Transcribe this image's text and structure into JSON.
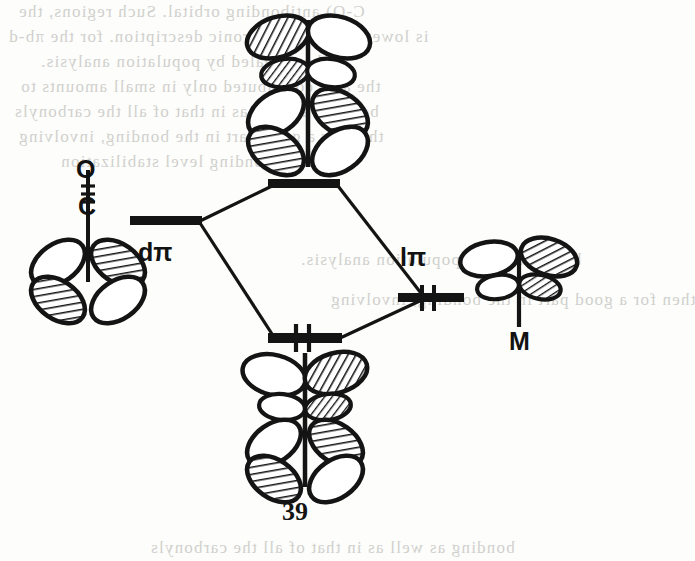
{
  "figure": {
    "number": "39",
    "caption_number": "39",
    "type": "molecular-orbital-interaction-diagram"
  },
  "labels": {
    "co_oxygen": "O",
    "co_carbon": "C",
    "d_pi": "dπ",
    "l_pi": "lπ",
    "metal": "M"
  },
  "energy_levels": [
    {
      "name": "antibonding",
      "label": "",
      "electrons": 0,
      "x": 305,
      "y": 185
    },
    {
      "name": "d-pi",
      "label": "dπ",
      "electrons": 0,
      "x": 166,
      "y": 222
    },
    {
      "name": "l-pi",
      "label": "lπ",
      "electrons": 2,
      "x": 430,
      "y": 298
    },
    {
      "name": "bonding",
      "label": "",
      "electrons": 2,
      "x": 305,
      "y": 338
    }
  ],
  "orbitals": [
    {
      "name": "antibonding-combination",
      "position": "top",
      "lobes": 6
    },
    {
      "name": "co-d-orbital",
      "position": "left",
      "lobes": 4
    },
    {
      "name": "metal-pi-orbital",
      "position": "right",
      "lobes": 4
    },
    {
      "name": "bonding-combination",
      "position": "bottom",
      "lobes": 6
    }
  ],
  "colors": {
    "ink": "#141414",
    "paper": "#fdfdfb",
    "bleed_text": "#c9c9c6"
  },
  "bleed_text": {
    "lines": [
      "C-O) antibonding orbital. Such regions, the",
      "is lowered. π*  isoelectronic description. for the πb-d",
      "be revealed by population analysis.",
      "the also contributed only in small amounts to",
      "bonding as well as in that of all the carbonyls",
      "then for a good part in the bonding, involving",
      "bonding level stabilization"
    ]
  }
}
